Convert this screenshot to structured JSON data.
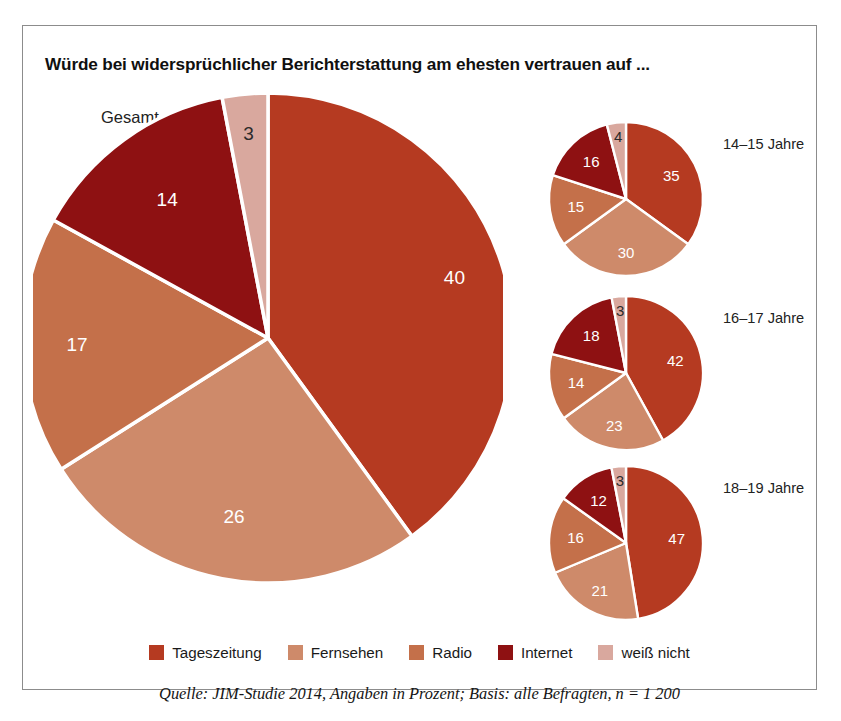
{
  "title": "Würde bei widersprüchlicher Berichterstattung am ehesten vertrauen auf ...",
  "source": "Quelle: JIM-Studie 2014, Angaben in Prozent; Basis: alle Befragten, n = 1 200",
  "colors": {
    "tageszeitung": "#b53a21",
    "fernsehen": "#ce8a6a",
    "radio": "#c4704a",
    "internet": "#8e1112",
    "weiss_nicht": "#d9a89e",
    "separator": "#ffffff",
    "frame": "#8c8c8c"
  },
  "legend": {
    "items": [
      {
        "label": "Tageszeitung",
        "color": "#b53a21"
      },
      {
        "label": "Fernsehen",
        "color": "#ce8a6a"
      },
      {
        "label": "Radio",
        "color": "#c4704a"
      },
      {
        "label": "Internet",
        "color": "#8e1112"
      },
      {
        "label": "weiß nicht",
        "color": "#d9a89e"
      }
    ]
  },
  "main_pie": {
    "label": "Gesamt",
    "values": [
      40,
      26,
      17,
      14,
      3
    ],
    "value_labels": [
      "40",
      "26",
      "17",
      "14",
      "3"
    ]
  },
  "small_pies": [
    {
      "label": "14–15 Jahre",
      "values": [
        35,
        30,
        15,
        16,
        4
      ],
      "value_labels": [
        "35",
        "30",
        "15",
        "16",
        "4"
      ]
    },
    {
      "label": "16–17 Jahre",
      "values": [
        42,
        23,
        14,
        18,
        3
      ],
      "value_labels": [
        "42",
        "23",
        "14",
        "18",
        "3"
      ]
    },
    {
      "label": "18–19 Jahre",
      "values": [
        47,
        21,
        16,
        12,
        3
      ],
      "value_labels": [
        "47",
        "21",
        "16",
        "12",
        "3"
      ]
    }
  ],
  "chart_data": {
    "type": "pie",
    "title": "Würde bei widersprüchlicher Berichterstattung am ehesten vertrauen auf ...",
    "subtitle": "",
    "xlabel": "",
    "ylabel": "",
    "unit": "Prozent",
    "legend_position": "bottom",
    "grid": false,
    "categories": [
      "Tageszeitung",
      "Fernsehen",
      "Radio",
      "Internet",
      "weiß nicht"
    ],
    "category_colors": [
      "#b53a21",
      "#ce8a6a",
      "#c4704a",
      "#8e1112",
      "#d9a89e"
    ],
    "series": [
      {
        "name": "Gesamt",
        "values": [
          40,
          26,
          17,
          14,
          3
        ]
      },
      {
        "name": "14–15 Jahre",
        "values": [
          35,
          30,
          15,
          16,
          4
        ]
      },
      {
        "name": "16–17 Jahre",
        "values": [
          42,
          23,
          14,
          18,
          3
        ]
      },
      {
        "name": "18–19 Jahre",
        "values": [
          47,
          21,
          16,
          12,
          3
        ]
      }
    ],
    "annotations": [
      "Quelle: JIM-Studie 2014, Angaben in Prozent; Basis: alle Befragten, n = 1 200"
    ]
  }
}
